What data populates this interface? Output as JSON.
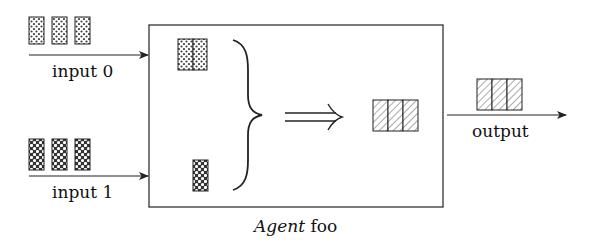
{
  "diagram": {
    "type": "agent-dataflow",
    "stroke_color": "#222222",
    "box": {
      "caption_italic": "Agent",
      "caption_rest": " foo"
    },
    "inputs": [
      {
        "label": "input 0",
        "pattern": "dotted",
        "cells": 3
      },
      {
        "label": "input 1",
        "pattern": "checkered",
        "cells": 3
      }
    ],
    "inner": {
      "buffer_0": {
        "pattern": "dotted",
        "cells": 2
      },
      "buffer_1": {
        "pattern": "checkered",
        "cells": 1
      },
      "combine_symbol": "brace",
      "implies_symbol": "double-right-arrow",
      "result": {
        "pattern": "hatched",
        "cells": 3
      }
    },
    "output": {
      "label": "output",
      "pattern": "hatched",
      "cells": 3
    }
  }
}
